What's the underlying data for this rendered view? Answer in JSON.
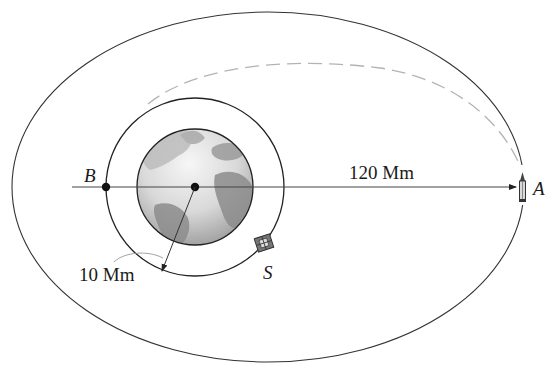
{
  "figure": {
    "type": "orbital-transfer-diagram",
    "labels": {
      "point_b": "B",
      "point_a": "A",
      "satellite": "S",
      "distance_a": "120 Mm",
      "radius_inner": "10 Mm"
    },
    "colors": {
      "line": "#222222",
      "dashed_path": "#b0b0b0",
      "earth_dark": "#7a7a7a",
      "earth_light": "#e6e6e6",
      "background": "#ffffff"
    },
    "elements": {
      "earth": "Earth globe at focus",
      "inner_orbit": "Circular orbit radius 10 Mm",
      "outer_orbit": "Elliptical orbit with apogee at A",
      "transfer_path": "Dashed transfer trajectory",
      "rocket": "Rocket at A",
      "satellite": "Satellite S on circular orbit"
    }
  }
}
